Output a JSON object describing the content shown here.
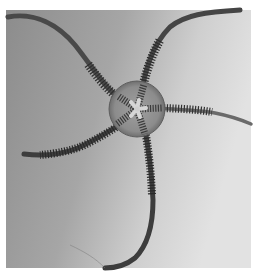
{
  "image": {
    "subject": "brittle star",
    "description": "Grayscale photograph of a brittle star (ophiuroid) with a round central disc and five long, slender, segmented arms radiating outward",
    "style": "black-and-white photograph",
    "arm_count": 5,
    "colors": {
      "page_background": "#ffffff",
      "photo_dark": "#8a8a8a",
      "photo_mid": "#a8a8a8",
      "photo_light": "#dedede",
      "disc_fill": "#8f8f8f",
      "arm_color": "#3a3a3a",
      "arm_spines": "#2a2a2a",
      "mouth_star": "#d8d8d8"
    }
  }
}
